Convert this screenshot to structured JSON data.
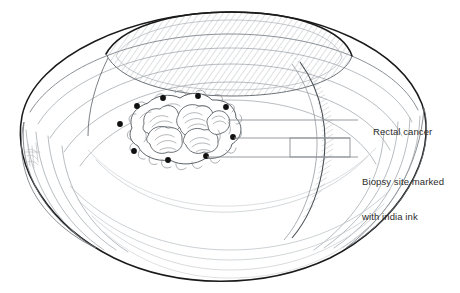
{
  "figure": {
    "style": "pen-and-ink medical line drawing",
    "background_color": "#ffffff",
    "ink_color": "#1a1a1a",
    "contour_color": "#9aa0a6",
    "leader_line_color": "#8a8f94",
    "text_color": "#2b2b2b"
  },
  "annotations": {
    "rectal_cancer": {
      "label": "Rectal cancer"
    },
    "biopsy_site": {
      "label_line1": "Biopsy site marked",
      "label_line2": "with india ink"
    }
  },
  "anatomy": {
    "organ_label": "rectum-viewed-from-above",
    "lumen_label": "rectal-lumen-opening",
    "tumor_label": "rectal-tumor-mass",
    "ink_dot_count": 9,
    "signature_label": "artist-signature"
  },
  "ink_dots": [
    {
      "cx": 163,
      "cy": 98
    },
    {
      "cx": 198,
      "cy": 96
    },
    {
      "cx": 137,
      "cy": 106
    },
    {
      "cx": 226,
      "cy": 107
    },
    {
      "cx": 120,
      "cy": 124
    },
    {
      "cx": 233,
      "cy": 137
    },
    {
      "cx": 134,
      "cy": 151
    },
    {
      "cx": 168,
      "cy": 160
    },
    {
      "cx": 206,
      "cy": 156
    }
  ],
  "leader_lines": [
    {
      "name": "leader-rectal-cancer",
      "x1": 228,
      "y1": 120,
      "x2": 358,
      "y2": 120
    },
    {
      "name": "leader-biopsy-upper",
      "x1": 234,
      "y1": 138,
      "x2": 350,
      "y2": 138
    },
    {
      "name": "leader-biopsy-lower",
      "x1": 207,
      "y1": 157,
      "x2": 350,
      "y2": 157
    }
  ],
  "bracket": {
    "name": "biopsy-bracket",
    "left": 290,
    "top": 138,
    "width": 60,
    "height": 19,
    "stem_x": 350,
    "stem_y": 157
  }
}
